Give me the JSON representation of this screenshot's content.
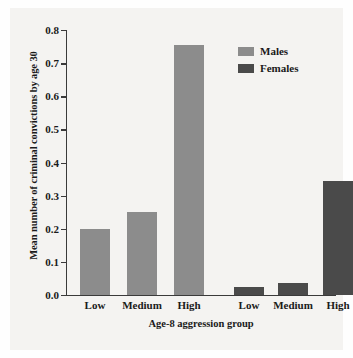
{
  "chart_data": {
    "type": "bar",
    "title": "",
    "xlabel": "Age-8 aggression group",
    "ylabel": "Mean number of criminal convictions by age 30",
    "ylim": [
      0.0,
      0.8
    ],
    "ytick_labels": [
      "0.0",
      "0.1",
      "0.2",
      "0.3",
      "0.4",
      "0.5",
      "0.6",
      "0.7",
      "0.8"
    ],
    "ytick_values": [
      0.0,
      0.1,
      0.2,
      0.3,
      0.4,
      0.5,
      0.6,
      0.7,
      0.8
    ],
    "grid": false,
    "legend_position": "top-right",
    "categories": [
      "Low",
      "Medium",
      "High"
    ],
    "series": [
      {
        "name": "Males",
        "color": "#8c8c8c",
        "values": [
          0.2,
          0.25,
          0.755
        ]
      },
      {
        "name": "Females",
        "color": "#4a4a4a",
        "values": [
          0.025,
          0.035,
          0.345
        ]
      }
    ],
    "bars": [
      {
        "group": "Males",
        "category": "Low",
        "value": 0.2,
        "label": "Low"
      },
      {
        "group": "Males",
        "category": "Medium",
        "value": 0.25,
        "label": "Medium"
      },
      {
        "group": "Males",
        "category": "High",
        "value": 0.755,
        "label": "High"
      },
      {
        "group": "Females",
        "category": "Low",
        "value": 0.025,
        "label": "Low"
      },
      {
        "group": "Females",
        "category": "Medium",
        "value": 0.035,
        "label": "Medium"
      },
      {
        "group": "Females",
        "category": "High",
        "value": 0.345,
        "label": "High"
      }
    ]
  },
  "legend": {
    "items": [
      {
        "label": "Males",
        "color": "#8c8c8c"
      },
      {
        "label": "Females",
        "color": "#4a4a4a"
      }
    ]
  },
  "colors": {
    "males": "#8c8c8c",
    "females": "#4a4a4a",
    "axis": "#3a3a3a",
    "text": "#1a1a1a",
    "plot_background": "#f4f3f1"
  }
}
